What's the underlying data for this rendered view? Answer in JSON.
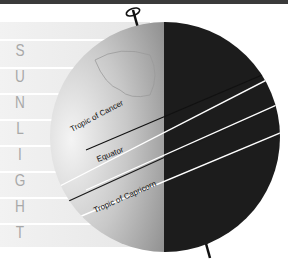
{
  "diagram": {
    "sunlight_letters": [
      "S",
      "U",
      "N",
      "L",
      "I",
      "G",
      "H",
      "T"
    ],
    "labels": {
      "tropic_cancer": "Tropic of Cancer",
      "equator": "Equator",
      "tropic_capricorn": "Tropic of Capricorn"
    },
    "colors": {
      "top_bar": "#3a3a3a",
      "sunlight_band": "#ececec",
      "day_side": "#b8b8b8",
      "night_side": "#1a1a1a",
      "letter": "#a8a8a8"
    }
  }
}
